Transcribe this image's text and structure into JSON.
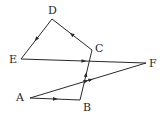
{
  "diagram": {
    "points": {
      "A": {
        "label": "A",
        "x": 30,
        "y": 98,
        "lx": 16,
        "ly": 92
      },
      "B": {
        "label": "B",
        "x": 80,
        "y": 100,
        "lx": 83,
        "ly": 102
      },
      "C": {
        "label": "C",
        "x": 92,
        "y": 50,
        "lx": 95,
        "ly": 43
      },
      "D": {
        "label": "D",
        "x": 52,
        "y": 19,
        "lx": 48,
        "ly": 5
      },
      "E": {
        "label": "E",
        "x": 21,
        "y": 59,
        "lx": 9,
        "ly": 54
      },
      "F": {
        "label": "F",
        "x": 146,
        "y": 63,
        "lx": 149,
        "ly": 58
      }
    },
    "segments": [
      {
        "from": "A",
        "to": "B",
        "arrows": 1
      },
      {
        "from": "B",
        "to": "C",
        "arrows": 1
      },
      {
        "from": "C",
        "to": "D",
        "arrows": 1
      },
      {
        "from": "D",
        "to": "E",
        "arrows": 1
      },
      {
        "from": "E",
        "to": "F",
        "arrows": 1
      },
      {
        "from": "A",
        "to": "F",
        "arrows": 2
      }
    ],
    "line_color": "#2a2a2a"
  }
}
